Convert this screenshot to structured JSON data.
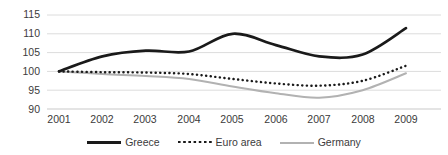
{
  "chart_data": {
    "type": "line",
    "title": "",
    "subtitle": "",
    "xlabel": "",
    "ylabel": "",
    "categories": [
      "2001",
      "2002",
      "2003",
      "2004",
      "2005",
      "2006",
      "2007",
      "2008",
      "2009"
    ],
    "x": [
      2001,
      2002,
      2003,
      2004,
      2005,
      2006,
      2007,
      2008,
      2009
    ],
    "ylim": [
      90,
      115
    ],
    "xlim": [
      2001,
      2009
    ],
    "yticks": [
      90,
      95,
      100,
      105,
      110,
      115
    ],
    "ytick_labels": [
      "90",
      "95",
      "100",
      "105",
      "110",
      "115"
    ],
    "xtick_labels": [
      "2001",
      "2002",
      "2003",
      "2004",
      "2005",
      "2006",
      "2007",
      "2008",
      "2009"
    ],
    "grid": "horizontal",
    "legend_position": "bottom-center",
    "series": [
      {
        "name": "Greece",
        "style": "solid-thick",
        "color": "#1a1a1a",
        "values": [
          100,
          104,
          105.5,
          105.3,
          110,
          107,
          104,
          104.5,
          111.5
        ]
      },
      {
        "name": "Euro area",
        "style": "dotted",
        "color": "#1a1a1a",
        "values": [
          100,
          99.8,
          99.7,
          99.3,
          98,
          96.8,
          96.2,
          97.5,
          101.5
        ]
      },
      {
        "name": "Germany",
        "style": "solid-gray",
        "color": "#b2b2b2",
        "values": [
          100,
          99.3,
          98.8,
          98,
          96,
          94.2,
          93,
          95,
          99.5
        ]
      }
    ],
    "colors": {
      "greece": "#1a1a1a",
      "euro_area": "#1a1a1a",
      "germany": "#b2b2b2",
      "gridline": "#d9d9d9",
      "text": "#3b3b3b",
      "background": "#ffffff"
    }
  },
  "legend": {
    "entries": [
      {
        "label": "Greece"
      },
      {
        "label": "Euro area"
      },
      {
        "label": "Germany"
      }
    ]
  }
}
